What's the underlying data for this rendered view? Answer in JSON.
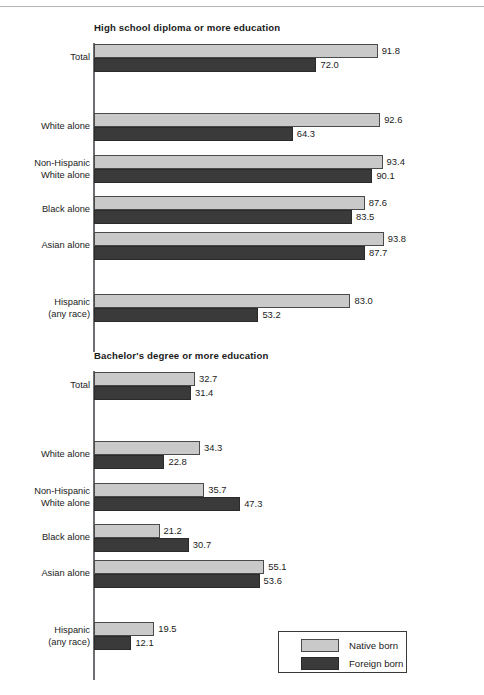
{
  "colors": {
    "native_born": "#c9c9c9",
    "foreign_born": "#3a3a3a",
    "bar_outline": "#4a4a4a",
    "axis": "#6e6e72",
    "text": "#1b1b1b",
    "background": "#ffffff",
    "top_rule": "#b4b4b8"
  },
  "legend": {
    "entries": [
      {
        "label": "Native born",
        "swatch": "native"
      },
      {
        "label": "Foreign born",
        "swatch": "foreign"
      }
    ]
  },
  "chart_data": [
    {
      "type": "bar",
      "orientation": "horizontal",
      "title": "High school diploma or more education",
      "xlabel": "",
      "ylabel": "",
      "xlim": [
        0,
        100
      ],
      "grid": false,
      "legend_position": "none",
      "categories": [
        "Total",
        "White alone",
        "Non-Hispanic\nWhite alone",
        "Black alone",
        "Asian alone",
        "Hispanic\n(any race)"
      ],
      "series": [
        {
          "name": "Native born",
          "values": [
            91.8,
            92.6,
            93.4,
            87.6,
            93.8,
            83.0
          ]
        },
        {
          "name": "Foreign born",
          "values": [
            72.0,
            64.3,
            90.1,
            83.5,
            87.7,
            53.2
          ]
        }
      ],
      "data_labels": [
        [
          "91.8",
          "72.0"
        ],
        [
          "92.6",
          "64.3"
        ],
        [
          "93.4",
          "90.1"
        ],
        [
          "87.6",
          "83.5"
        ],
        [
          "93.8",
          "87.7"
        ],
        [
          "83.0",
          "53.2"
        ]
      ]
    },
    {
      "type": "bar",
      "orientation": "horizontal",
      "title": "Bachelor's degree or more education",
      "xlabel": "",
      "ylabel": "",
      "xlim": [
        0,
        100
      ],
      "grid": false,
      "legend_position": "bottom-right",
      "categories": [
        "Total",
        "White alone",
        "Non-Hispanic\nWhite alone",
        "Black alone",
        "Asian alone",
        "Hispanic\n(any race)"
      ],
      "series": [
        {
          "name": "Native born",
          "values": [
            32.7,
            34.3,
            35.7,
            21.2,
            55.1,
            19.5
          ]
        },
        {
          "name": "Foreign born",
          "values": [
            31.4,
            22.8,
            47.3,
            30.7,
            53.6,
            12.1
          ]
        }
      ],
      "data_labels": [
        [
          "32.7",
          "31.4"
        ],
        [
          "34.3",
          "22.8"
        ],
        [
          "35.7",
          "47.3"
        ],
        [
          "21.2",
          "30.7"
        ],
        [
          "55.1",
          "53.6"
        ],
        [
          "19.5",
          "12.1"
        ]
      ]
    }
  ]
}
